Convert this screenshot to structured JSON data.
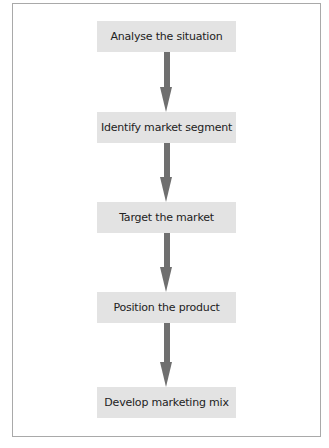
{
  "diagram": {
    "type": "vertical-flowchart",
    "steps": [
      {
        "label": "Analyse the situation"
      },
      {
        "label": "Identify market segment"
      },
      {
        "label": "Target the market"
      },
      {
        "label": "Position the product"
      },
      {
        "label": "Develop marketing mix"
      }
    ],
    "connections": [
      {
        "from": "Analyse the situation",
        "to": "Identify market segment"
      },
      {
        "from": "Identify market segment",
        "to": "Target the market"
      },
      {
        "from": "Target the market",
        "to": "Position the product"
      },
      {
        "from": "Position the product",
        "to": "Develop marketing mix"
      }
    ],
    "colors": {
      "box_fill": "#e3e3e3",
      "arrow": "#6f6f6f",
      "frame_border": "#a9a9a9",
      "text": "#222222"
    }
  }
}
